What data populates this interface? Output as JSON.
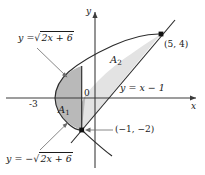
{
  "figure": {
    "type": "math-graph",
    "background": "#ffffff",
    "axes": {
      "x_axis_label": "x",
      "y_axis_label": "y",
      "origin_label": "0",
      "x_tick_labels": [
        "-3"
      ],
      "origin_px": [
        95,
        98
      ],
      "x_scale_px_per_unit": 13.3,
      "y_scale_px_per_unit": 16.0
    },
    "curves": [
      {
        "name": "upper-parabola",
        "label": "y = √(2x + 6)",
        "label_parts": {
          "lhs": "y =",
          "radicand": "2x + 6"
        },
        "equation": "y = sqrt(2x+6)"
      },
      {
        "name": "lower-parabola",
        "label": "y = −√(2x + 6)",
        "label_parts": {
          "lhs": "y = −",
          "radicand": "2x + 6"
        },
        "equation": "y = -sqrt(2x+6)"
      },
      {
        "name": "line",
        "label_parts": {
          "lhs": "y =",
          "rhs": "x − 1"
        },
        "label": "y = x − 1",
        "equation": "y = x - 1"
      }
    ],
    "points": [
      {
        "name": "intersection-upper",
        "label": "(5, 4)",
        "x": 5,
        "y": 4
      },
      {
        "name": "intersection-lower",
        "label": "(−1, −2)",
        "x": -1,
        "y": -2
      }
    ],
    "regions": [
      {
        "name": "region-a1",
        "label": "A",
        "subscript": "1",
        "fill": "#b9b9b9",
        "x_range": [
          -3,
          -1
        ]
      },
      {
        "name": "region-a2",
        "label": "A",
        "subscript": "2",
        "fill": "#e3e3e3",
        "x_range": [
          -1,
          5
        ]
      }
    ],
    "colors": {
      "axis": "#3c3c3c",
      "curve": "#2b2b2b",
      "region_dark": "#b9b9b9",
      "region_light": "#e3e3e3",
      "text": "#1a1a1a"
    }
  }
}
